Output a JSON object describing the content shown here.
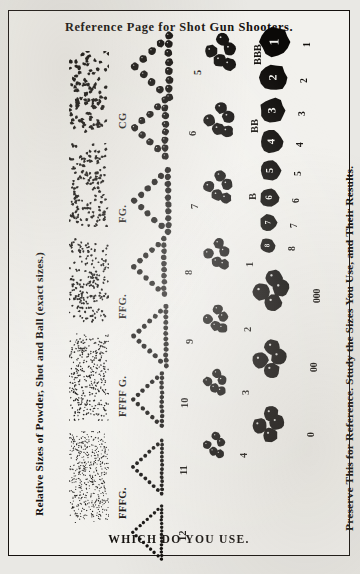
{
  "page": {
    "title": "Reference Page for Shot Gun Shooters.",
    "bottom_caption": "WHICH DO YOU USE.",
    "left_caption": "Relative Sizes of Powder, Shot and Ball (exact sizes.)",
    "right_caption": "Preserve This for Reference.  Study the Sizes You Use, and Their Results.",
    "border_color": "#15110e",
    "ink_color": "#100d0a",
    "paper_color": "#f2f1ed"
  },
  "powder_column": {
    "heading": "Powder grades",
    "grades": [
      {
        "label": "CG",
        "grain_px": 3.9,
        "count": 120,
        "patch_w": 40,
        "patch_h": 82,
        "y": 8
      },
      {
        "label": "FG.",
        "grain_px": 3.0,
        "count": 165,
        "patch_w": 40,
        "patch_h": 84,
        "y": 100
      },
      {
        "label": "FFG.",
        "grain_px": 2.4,
        "count": 230,
        "patch_w": 40,
        "patch_h": 86,
        "y": 194
      },
      {
        "label": "FFFF G.",
        "grain_px": 1.7,
        "count": 400,
        "patch_w": 40,
        "patch_h": 88,
        "y": 290
      },
      {
        "label": "FFFG.",
        "grain_px": 1.3,
        "count": 560,
        "patch_w": 40,
        "patch_h": 92,
        "y": 388
      }
    ]
  },
  "shot_column": {
    "heading": "Shot sizes",
    "shape": "triangle",
    "sizes": [
      {
        "label": "5",
        "pellet_px": 8.0,
        "rows": 5,
        "y": 10
      },
      {
        "label": "6",
        "pellet_px": 7.2,
        "rows": 5,
        "y": 76
      },
      {
        "label": "7",
        "pellet_px": 6.4,
        "rows": 6,
        "y": 146
      },
      {
        "label": "8",
        "pellet_px": 5.7,
        "rows": 6,
        "y": 216
      },
      {
        "label": "9",
        "pellet_px": 5.1,
        "rows": 7,
        "y": 284
      },
      {
        "label": "10",
        "pellet_px": 4.5,
        "rows": 7,
        "y": 352
      },
      {
        "label": "11",
        "pellet_px": 3.9,
        "rows": 8,
        "y": 420
      },
      {
        "label": "12",
        "pellet_px": 3.4,
        "rows": 9,
        "y": 486
      }
    ]
  },
  "buck_column": {
    "heading": "Large shot and buckshot clusters",
    "shape": "cluster",
    "sizes": [
      {
        "label": "BBB",
        "pellet_px": 13.0,
        "y": 18
      },
      {
        "label": "BB",
        "pellet_px": 12.2,
        "y": 88
      },
      {
        "label": "B",
        "pellet_px": 11.4,
        "y": 156
      },
      {
        "label": "1",
        "pellet_px": 10.6,
        "y": 224
      },
      {
        "label": "2",
        "pellet_px": 10.0,
        "y": 290
      },
      {
        "label": "3",
        "pellet_px": 9.3,
        "y": 354
      },
      {
        "label": "4",
        "pellet_px": 8.7,
        "y": 418
      }
    ]
  },
  "ball_column": {
    "heading": "Buck ball sizes",
    "numbered_balls": [
      {
        "label": "1",
        "inner": "1",
        "diameter_px": 30
      },
      {
        "label": "2",
        "inner": "2",
        "diameter_px": 27
      },
      {
        "label": "3",
        "inner": "3",
        "diameter_px": 25
      },
      {
        "label": "4",
        "inner": "4",
        "diameter_px": 23
      },
      {
        "label": "5",
        "inner": "5",
        "diameter_px": 21
      },
      {
        "label": "6",
        "inner": "6",
        "diameter_px": 19
      },
      {
        "label": "7",
        "inner": "7",
        "diameter_px": 17
      },
      {
        "label": "8",
        "inner": "8",
        "diameter_px": 15
      }
    ],
    "clusters": [
      {
        "label": "000",
        "pellet_px": 17.0
      },
      {
        "label": "00",
        "pellet_px": 16.0
      },
      {
        "label": "0",
        "pellet_px": 15.0
      }
    ]
  }
}
